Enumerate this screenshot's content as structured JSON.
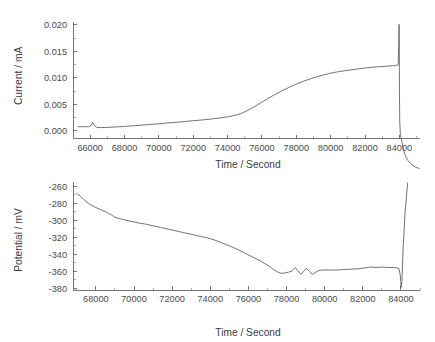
{
  "figure": {
    "background_color": "#ffffff",
    "line_color": "#5a5a5a",
    "axis_color": "#666666",
    "text_color": "#3c3c3c"
  },
  "panels": {
    "current": {
      "name": "current-vs-time-plot",
      "xlabel": "Time / Second",
      "ylabel": "Current / mA",
      "xticks": [
        "66000",
        "68000",
        "70000",
        "72000",
        "74000",
        "76000",
        "78000",
        "80000",
        "82000",
        "84000"
      ],
      "yticks": [
        "0.000",
        "0.005",
        "0.010",
        "0.015",
        "0.020"
      ]
    },
    "potential": {
      "name": "potential-vs-time-plot",
      "xlabel": "Time / Second",
      "ylabel": "Potential / mV",
      "xticks": [
        "68000",
        "70000",
        "72000",
        "74000",
        "76000",
        "78000",
        "80000",
        "82000",
        "84000"
      ],
      "yticks": [
        "-380",
        "-360",
        "-340",
        "-320",
        "-300",
        "-280",
        "-260"
      ]
    }
  },
  "chart_data": [
    {
      "type": "line",
      "name": "current-vs-time",
      "title": "",
      "xlabel": "Time / Second",
      "ylabel": "Current / mA",
      "xlim": [
        65000,
        85200
      ],
      "ylim": [
        -0.0015,
        0.0205
      ],
      "xticks": [
        66000,
        68000,
        70000,
        72000,
        74000,
        76000,
        78000,
        80000,
        82000,
        84000
      ],
      "yticks": [
        0.0,
        0.005,
        0.01,
        0.015,
        0.02
      ],
      "grid": false,
      "legend": null,
      "x": [
        65300,
        65600,
        65900,
        66050,
        66150,
        66220,
        66300,
        66400,
        66600,
        66900,
        67200,
        67600,
        68000,
        68500,
        69000,
        69500,
        70000,
        70500,
        71000,
        71500,
        72000,
        72500,
        73000,
        73500,
        74000,
        74300,
        74600,
        74900,
        75200,
        75600,
        76000,
        76400,
        76800,
        77200,
        77600,
        78000,
        78400,
        78800,
        79200,
        79600,
        80000,
        80400,
        80800,
        81200,
        81600,
        82000,
        82400,
        82800,
        83200,
        83600,
        83850,
        83930,
        83960,
        83975,
        83985,
        83995,
        84005,
        84020,
        84060,
        84120,
        84200,
        84320,
        84480,
        84700,
        84950,
        85150
      ],
      "y": [
        0.00075,
        0.00075,
        0.00075,
        0.00095,
        0.00155,
        0.0011,
        0.00078,
        0.00062,
        0.00058,
        0.0006,
        0.00065,
        0.00072,
        0.0008,
        0.00092,
        0.00105,
        0.00118,
        0.0013,
        0.00145,
        0.00158,
        0.00172,
        0.00188,
        0.00202,
        0.00218,
        0.00238,
        0.00262,
        0.0028,
        0.00305,
        0.0034,
        0.0039,
        0.0046,
        0.0054,
        0.00618,
        0.00692,
        0.0076,
        0.00822,
        0.0088,
        0.00932,
        0.00978,
        0.01018,
        0.01055,
        0.01088,
        0.01112,
        0.01132,
        0.0115,
        0.01168,
        0.01185,
        0.01198,
        0.01208,
        0.01218,
        0.01228,
        0.01238,
        0.01245,
        0.016,
        0.0196,
        0.0201,
        0.015,
        0.007,
        0.002,
        -0.0009,
        -0.0016,
        -0.0031,
        -0.0045,
        -0.0056,
        -0.0064,
        -0.0069,
        -0.00715
      ],
      "annotations": [
        {
          "text": "initial transient spike",
          "x": 66150,
          "y": 0.00155
        },
        {
          "text": "sharp anodic spike at end of run",
          "x": 83985,
          "y": 0.0201
        }
      ]
    },
    {
      "type": "line",
      "name": "potential-vs-time",
      "title": "",
      "xlabel": "Time / Second",
      "ylabel": "Potential / mV",
      "xlim": [
        66800,
        85000
      ],
      "ylim": [
        -382,
        -255
      ],
      "xticks": [
        68000,
        70000,
        72000,
        74000,
        76000,
        78000,
        80000,
        82000,
        84000
      ],
      "yticks": [
        -380,
        -360,
        -340,
        -320,
        -300,
        -280,
        -260
      ],
      "grid": false,
      "legend": null,
      "x": [
        67000,
        67200,
        67400,
        67700,
        68000,
        68300,
        68600,
        68800,
        69000,
        69400,
        69800,
        70200,
        70600,
        71000,
        71400,
        71800,
        72200,
        72600,
        73000,
        73400,
        73800,
        74200,
        74600,
        75000,
        75400,
        75800,
        76200,
        76600,
        76900,
        77150,
        77350,
        77550,
        77750,
        77900,
        78100,
        78300,
        78450,
        78600,
        78750,
        78900,
        79050,
        79200,
        79350,
        79500,
        79700,
        79900,
        80200,
        80600,
        81000,
        81400,
        81800,
        82100,
        82400,
        82700,
        83000,
        83300,
        83600,
        83800,
        83900,
        83960,
        83990,
        84010,
        84050,
        84120,
        84220,
        84350
      ],
      "y": [
        -268.5,
        -272.0,
        -276.5,
        -281.5,
        -285.0,
        -288.0,
        -291.0,
        -293.5,
        -296.5,
        -299.0,
        -301.0,
        -303.0,
        -304.5,
        -306.5,
        -308.5,
        -310.5,
        -312.5,
        -314.5,
        -316.5,
        -318.5,
        -320.5,
        -323.0,
        -326.5,
        -330.0,
        -334.0,
        -338.5,
        -343.0,
        -347.5,
        -351.5,
        -355.0,
        -358.5,
        -361.0,
        -362.5,
        -362.0,
        -361.0,
        -359.5,
        -355.5,
        -359.5,
        -363.5,
        -360.0,
        -356.5,
        -360.0,
        -363.5,
        -361.5,
        -359.0,
        -358.5,
        -358.5,
        -358.5,
        -358.0,
        -357.5,
        -357.0,
        -356.0,
        -355.0,
        -355.5,
        -355.0,
        -355.5,
        -355.5,
        -356.0,
        -357.0,
        -364.0,
        -372.0,
        -379.0,
        -372.0,
        -330.0,
        -290.0,
        -256.0
      ],
      "annotations": [
        {
          "text": "potential oscillations around -360 mV",
          "x": 78600,
          "y": -360
        },
        {
          "text": "sharp dip then steep rise off-scale at end of run",
          "x": 84000,
          "y": -379
        }
      ]
    }
  ]
}
